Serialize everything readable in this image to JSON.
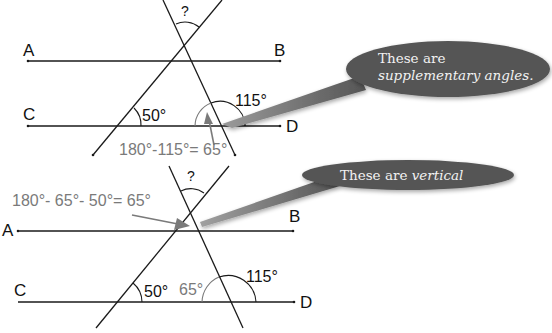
{
  "top_diagram": {
    "points": {
      "A": "A",
      "B": "B",
      "C": "C",
      "D": "D"
    },
    "unknown_angle": "?",
    "angle_50": "50°",
    "angle_115": "115°",
    "equation": "180°-115°= 65°",
    "callout": {
      "line1": "These are",
      "line2": "supplementary angles."
    }
  },
  "bottom_diagram": {
    "points": {
      "A": "A",
      "B": "B",
      "C": "C",
      "D": "D"
    },
    "unknown_angle": "?",
    "angle_50": "50°",
    "angle_65": "65°",
    "angle_115": "115°",
    "equation": "180°- 65°- 50°= 65°",
    "callout": {
      "prefix": "These are ",
      "emphasis": "vertical"
    }
  },
  "colors": {
    "line": "#1a1a1a",
    "annotation_gray": "#7a7a7a",
    "bubble": "#555555",
    "bubble_text": "#f2f2f2"
  }
}
